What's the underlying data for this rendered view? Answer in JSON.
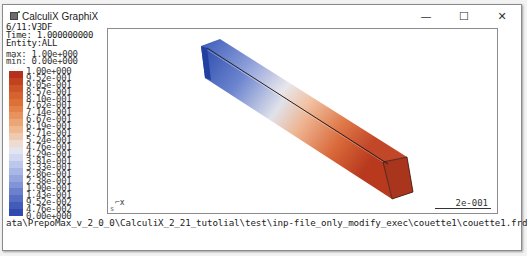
{
  "window": {
    "title": "CalculiX GraphiX",
    "controls": {
      "minimize": "—",
      "maximize": "☐",
      "close": "✕"
    }
  },
  "info": {
    "step": "6/11:V3DF",
    "time": "Time: 1.000000000",
    "entity": "Entity:ALL",
    "max": "max: 1.00e+000",
    "min": "min: 0.00e+000"
  },
  "legend": {
    "labels": [
      "1.00e+000",
      "9.52e-001",
      "9.05e-001",
      "8.57e-001",
      "8.10e-001",
      "7.62e-001",
      "7.14e-001",
      "6.67e-001",
      "6.19e-001",
      "5.71e-001",
      "5.24e-001",
      "4.76e-001",
      "4.29e-001",
      "3.81e-001",
      "3.33e-001",
      "2.86e-001",
      "2.38e-001",
      "1.90e-001",
      "1.43e-001",
      "9.52e-002",
      "4.76e-002",
      "0.00e+000"
    ],
    "colors": [
      "#b5301f",
      "#c2421f",
      "#cc5426",
      "#d5622f",
      "#dc7138",
      "#e2814a",
      "#e8925e",
      "#eca574",
      "#efb891",
      "#efcab1",
      "#eedbd2",
      "#e4e4ee",
      "#d2d8f0",
      "#bdc7ec",
      "#a8b7e6",
      "#95a6df",
      "#8094d6",
      "#6b81cd",
      "#576ec3",
      "#445cb9",
      "#3249ad",
      "#203aa2"
    ]
  },
  "viewport": {
    "scale_label": "2e-001",
    "axis_label": "x",
    "corner_label": "s"
  },
  "status": {
    "path": "ata\\PrepoMax_v_2_0_0\\CalculiX_2_21_tutolial\\test\\inp-file_only_modify_exec\\couette1\\couette1.frd"
  }
}
